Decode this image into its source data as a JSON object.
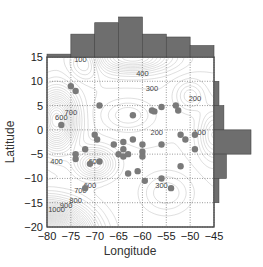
{
  "chart_data": {
    "type": "scatter",
    "title": "",
    "xlabel": "Longitude",
    "ylabel": "Latitude",
    "xlim": [
      -80,
      -45
    ],
    "ylim": [
      -20,
      15
    ],
    "x_ticks": [
      -80,
      -75,
      -70,
      -65,
      -60,
      -55,
      -50,
      -45
    ],
    "y_ticks": [
      15,
      10,
      5,
      0,
      -5,
      -10,
      -15,
      -20
    ],
    "grid": true,
    "background": "contour map with labeled contour lines",
    "contour_labels": [
      {
        "value": "100",
        "lon": -73,
        "lat": 14
      },
      {
        "value": "500",
        "lon": -60,
        "lat": 15
      },
      {
        "value": "400",
        "lon": -60,
        "lat": 11
      },
      {
        "value": "300",
        "lon": -58,
        "lat": 8
      },
      {
        "value": "200",
        "lon": -49,
        "lat": 6
      },
      {
        "value": "600",
        "lon": -77,
        "lat": 2
      },
      {
        "value": "700",
        "lon": -75,
        "lat": 3
      },
      {
        "value": "200",
        "lon": -57,
        "lat": -1
      },
      {
        "value": "100",
        "lon": -48,
        "lat": -1
      },
      {
        "value": "400",
        "lon": -78,
        "lat": -7
      },
      {
        "value": "600",
        "lon": -70,
        "lat": -7
      },
      {
        "value": "300",
        "lon": -56,
        "lat": -12
      },
      {
        "value": "600",
        "lon": -71,
        "lat": -12
      },
      {
        "value": "700",
        "lon": -73,
        "lat": -13
      },
      {
        "value": "800",
        "lon": -74,
        "lat": -15
      },
      {
        "value": "900",
        "lon": -76,
        "lat": -16
      },
      {
        "value": "1000",
        "lon": -78,
        "lat": -17
      }
    ],
    "points": [
      {
        "lon": -75,
        "lat": 9
      },
      {
        "lon": -74,
        "lat": 8
      },
      {
        "lon": -69,
        "lat": 5
      },
      {
        "lon": -77,
        "lat": 1
      },
      {
        "lon": -62,
        "lat": 3
      },
      {
        "lon": -58,
        "lat": 4
      },
      {
        "lon": -57.5,
        "lat": 3.8
      },
      {
        "lon": -56,
        "lat": 4.7
      },
      {
        "lon": -52.5,
        "lat": 4
      },
      {
        "lon": -53,
        "lat": 5
      },
      {
        "lon": -70,
        "lat": -1
      },
      {
        "lon": -69.5,
        "lat": -2
      },
      {
        "lon": -72,
        "lat": -4
      },
      {
        "lon": -74,
        "lat": -5
      },
      {
        "lon": -74,
        "lat": -6
      },
      {
        "lon": -66,
        "lat": -3
      },
      {
        "lon": -64,
        "lat": -2.5
      },
      {
        "lon": -64,
        "lat": -4
      },
      {
        "lon": -65,
        "lat": -5
      },
      {
        "lon": -64,
        "lat": -5.5
      },
      {
        "lon": -63,
        "lat": -5
      },
      {
        "lon": -62,
        "lat": -2
      },
      {
        "lon": -60,
        "lat": -3
      },
      {
        "lon": -60,
        "lat": -4.5
      },
      {
        "lon": -60,
        "lat": -5.5
      },
      {
        "lon": -56,
        "lat": -3
      },
      {
        "lon": -69,
        "lat": -6.5
      },
      {
        "lon": -71,
        "lat": -7
      },
      {
        "lon": -63,
        "lat": -9
      },
      {
        "lon": -61,
        "lat": -8.5
      },
      {
        "lon": -59.5,
        "lat": -10.5
      },
      {
        "lon": -56,
        "lat": -10
      },
      {
        "lon": -54,
        "lat": -12
      },
      {
        "lon": -52,
        "lat": -7.5
      },
      {
        "lon": -52,
        "lat": -1
      },
      {
        "lon": -49,
        "lat": -4
      },
      {
        "lon": -49,
        "lat": -1
      },
      {
        "lon": -51,
        "lat": -2
      },
      {
        "lon": -72,
        "lat": -12
      }
    ],
    "marginal_histograms": {
      "top": {
        "axis": "Longitude",
        "bins": [
          [
            -80,
            -75
          ],
          [
            -75,
            -70
          ],
          [
            -70,
            -65
          ],
          [
            -65,
            -60
          ],
          [
            -60,
            -55
          ],
          [
            -55,
            -50
          ],
          [
            -50,
            -45
          ]
        ],
        "counts": [
          1,
          8,
          12,
          14,
          8,
          7,
          4
        ]
      },
      "right": {
        "axis": "Latitude",
        "bins": [
          [
            10,
            15
          ],
          [
            5,
            10
          ],
          [
            0,
            5
          ],
          [
            -5,
            0
          ],
          [
            -10,
            -5
          ],
          [
            -15,
            -10
          ],
          [
            -20,
            -15
          ]
        ],
        "counts": [
          0,
          2,
          4,
          15,
          5,
          2,
          0
        ]
      }
    },
    "colors": {
      "bars": "#6e6e6e",
      "points": "#7a7a7a",
      "contours": "#9a9a9a",
      "grid": "#555555"
    }
  }
}
